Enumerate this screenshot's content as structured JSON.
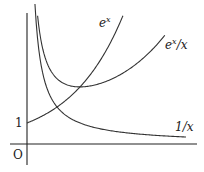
{
  "chart_data": {
    "type": "line",
    "title": "",
    "xlabel": "",
    "ylabel": "",
    "grid": false,
    "legend": "inline labels",
    "axes": {
      "origin_label": "O",
      "y_tick_labels": [
        "1"
      ],
      "y_ticks": [
        1
      ]
    },
    "series": [
      {
        "name": "e^x",
        "label_base": "e",
        "label_sup": "x",
        "label_tail": "",
        "function": "exp(x)",
        "x_range": [
          0,
          1.81
        ],
        "x": [
          0,
          0.25,
          0.5,
          0.567,
          0.75,
          1.0,
          1.25,
          1.5,
          1.81
        ],
        "y": [
          1.0,
          1.284,
          1.649,
          1.763,
          2.117,
          2.718,
          3.49,
          4.482,
          6.11
        ]
      },
      {
        "name": "e^x/x",
        "label_base": "e",
        "label_sup": "x",
        "label_tail": "/x",
        "function": "exp(x)/x",
        "x_range": [
          0.2,
          2.6
        ],
        "x": [
          0.2,
          0.3,
          0.5,
          0.75,
          1.0,
          1.5,
          2.0,
          2.6
        ],
        "y": [
          6.107,
          4.5,
          3.297,
          2.823,
          2.718,
          2.988,
          3.695,
          5.16
        ]
      },
      {
        "name": "1/x",
        "label_base": "1/x",
        "label_sup": "",
        "label_tail": "",
        "function": "1/x",
        "x_range": [
          0.15,
          3.0
        ],
        "x": [
          0.15,
          0.25,
          0.5,
          0.567,
          1.0,
          1.5,
          2.0,
          3.0
        ],
        "y": [
          6.667,
          4.0,
          2.0,
          1.763,
          1.0,
          0.667,
          0.5,
          0.333
        ]
      }
    ],
    "annotations": [
      "e^x and e^x/x intersect at (1, e), minimum of e^x/x",
      "e^x and 1/x intersect near x = 0.567"
    ],
    "xlim": [
      -0.3,
      3.2
    ],
    "ylim": [
      -1.3,
      6.9
    ]
  },
  "labels": {
    "origin": "O",
    "one": "1",
    "ex_base": "e",
    "ex_sup": "x",
    "exx_base": "e",
    "exx_sup": "x",
    "exx_tail": "/x",
    "inv": "1/x"
  }
}
